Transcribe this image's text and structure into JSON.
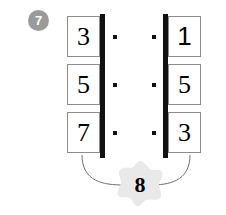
{
  "worksheet": {
    "question_number": "7",
    "left_column": {
      "label": "left-factor-column",
      "cells": [
        "3",
        "5",
        "7"
      ]
    },
    "right_column": {
      "label": "right-factor-column",
      "cells": [
        "1",
        "5",
        "3"
      ]
    },
    "operator_dots": {
      "symbol": "·",
      "rows": 3,
      "per_row": 2
    },
    "answer_star": {
      "value": "8",
      "shape": "star"
    },
    "colors": {
      "badge_fill": "#9a9a9a",
      "badge_text": "#ffffff",
      "box_border": "#8c8c8c",
      "bar": "#111111",
      "dot": "#111111",
      "star_fill": "#e9e9e9",
      "connector": "#6f6f6f",
      "digit": "#000000",
      "background": "#ffffff"
    }
  }
}
